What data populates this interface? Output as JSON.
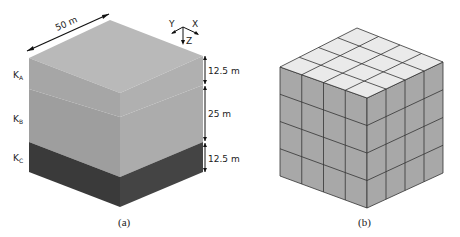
{
  "figure": {
    "panel_a": {
      "caption": "(a)",
      "width_label": "50 m",
      "axes": {
        "x": "X",
        "y": "Y",
        "z": "Z"
      },
      "layers": [
        {
          "label_main": "K",
          "label_sub": "A",
          "thickness": "12.5 m",
          "top_color": "#b9b9b9",
          "left_color": "#a6a6a6",
          "right_color": "#b0b0b0"
        },
        {
          "label_main": "K",
          "label_sub": "B",
          "thickness": "25 m",
          "left_color": "#9e9e9e",
          "right_color": "#acacac"
        },
        {
          "label_main": "K",
          "label_sub": "C",
          "thickness": "12.5 m",
          "left_color": "#3a3a3a",
          "right_color": "#444444"
        }
      ]
    },
    "panel_b": {
      "caption": "(b)",
      "grid": {
        "cols": 4,
        "rows": 4,
        "layers": 4
      },
      "top_color": "#eaeaea",
      "side_color": "#a8a8a8",
      "line_color": "#333333"
    }
  }
}
